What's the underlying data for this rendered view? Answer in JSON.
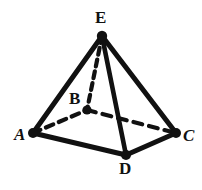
{
  "figure": {
    "kind": "hand-drawn-geometry-diagram",
    "shape_name": "square pyramid",
    "background_color": "#ffffff",
    "ink_color": "#111111",
    "canvas": {
      "width": 202,
      "height": 190
    },
    "vertices": [
      {
        "id": "E",
        "label": "E",
        "role": "apex",
        "x": 102,
        "y": 36,
        "label_x": 95,
        "label_y": 9,
        "dot_radius": 5.2,
        "italic": false
      },
      {
        "id": "A",
        "label": "A",
        "role": "base-left",
        "x": 33,
        "y": 133,
        "label_x": 14,
        "label_y": 126,
        "dot_radius": 5.0,
        "italic": true
      },
      {
        "id": "B",
        "label": "B",
        "role": "base-hidden",
        "x": 87,
        "y": 110,
        "label_x": 69,
        "label_y": 90,
        "dot_radius": 4.6,
        "italic": false
      },
      {
        "id": "C",
        "label": "C",
        "role": "base-right",
        "x": 176,
        "y": 133,
        "label_x": 183,
        "label_y": 127,
        "dot_radius": 5.0,
        "italic": true
      },
      {
        "id": "D",
        "label": "D",
        "role": "base-front",
        "x": 126,
        "y": 155,
        "label_x": 119,
        "label_y": 160,
        "dot_radius": 5.0,
        "italic": false
      }
    ],
    "edges": [
      {
        "id": "EA",
        "from": "E",
        "to": "A",
        "style": "solid",
        "hidden": false,
        "width": 5.0
      },
      {
        "id": "EC",
        "from": "E",
        "to": "C",
        "style": "solid",
        "hidden": false,
        "width": 5.0
      },
      {
        "id": "ED",
        "from": "E",
        "to": "D",
        "style": "solid",
        "hidden": false,
        "width": 4.6
      },
      {
        "id": "AD",
        "from": "A",
        "to": "D",
        "style": "solid",
        "hidden": false,
        "width": 5.0
      },
      {
        "id": "DC",
        "from": "D",
        "to": "C",
        "style": "solid",
        "hidden": false,
        "width": 5.0
      },
      {
        "id": "EB",
        "from": "E",
        "to": "B",
        "style": "dashed",
        "hidden": true,
        "width": 4.2,
        "dash": "7,5"
      },
      {
        "id": "AB",
        "from": "A",
        "to": "B",
        "style": "dashed",
        "hidden": true,
        "width": 4.2,
        "dash": "8,6"
      },
      {
        "id": "BC",
        "from": "B",
        "to": "C",
        "style": "dashed",
        "hidden": true,
        "width": 4.2,
        "dash": "9,7"
      }
    ]
  }
}
